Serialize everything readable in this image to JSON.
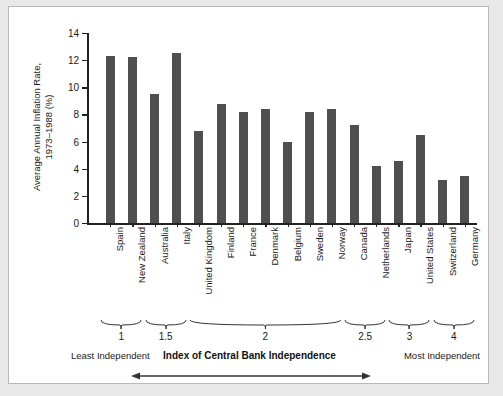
{
  "figure": {
    "y_axis_title": "Average Annual Inflation Rate,\n1973–1988 (%)",
    "x_axis_title": "Index of Central Bank Independence",
    "left_end_label": "Least\nIndependent",
    "right_end_label": "Most\nIndependent",
    "arrow_icon": "double-arrow-icon",
    "bar_color": "#4f4f4f",
    "axis_color": "#222222",
    "background": "#ffffff",
    "page_background": "#e8e8e8"
  },
  "chart_data": {
    "type": "bar",
    "title": "",
    "xlabel": "Index of Central Bank Independence",
    "ylabel": "Average Annual Inflation Rate, 1973–1988 (%)",
    "ylim": [
      0,
      14
    ],
    "yticks": [
      0,
      2,
      4,
      6,
      8,
      10,
      12,
      14
    ],
    "grid": false,
    "legend": null,
    "categories": [
      "Spain",
      "New Zealand",
      "Australia",
      "Italy",
      "United Kingdom",
      "Finland",
      "France",
      "Denmark",
      "Belgium",
      "Sweden",
      "Norway",
      "Canada",
      "Netherlands",
      "Japan",
      "United States",
      "Switzerland",
      "Germany"
    ],
    "values": [
      12.3,
      12.2,
      9.5,
      12.5,
      6.8,
      8.8,
      8.2,
      8.4,
      6.0,
      8.2,
      8.4,
      7.2,
      4.2,
      4.6,
      6.5,
      3.2,
      3.5
    ],
    "index_groups": [
      {
        "label": "1",
        "start_category": 0,
        "end_category": 1
      },
      {
        "label": "1.5",
        "start_category": 2,
        "end_category": 3
      },
      {
        "label": "2",
        "start_category": 4,
        "end_category": 10
      },
      {
        "label": "2.5",
        "start_category": 11,
        "end_category": 12
      },
      {
        "label": "3",
        "start_category": 13,
        "end_category": 14
      },
      {
        "label": "4",
        "start_category": 15,
        "end_category": 16
      }
    ]
  }
}
